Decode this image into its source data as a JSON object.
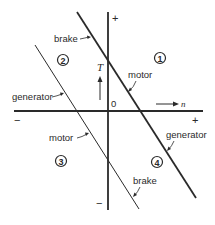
{
  "diagram": {
    "type": "four-quadrant torque-speed diagram",
    "axes": {
      "vertical": {
        "label": "T",
        "positive": "+",
        "negative": "−"
      },
      "horizontal": {
        "label": "n",
        "positive": "+",
        "negative": "−"
      },
      "origin": "0"
    },
    "quadrants": [
      {
        "id": "1",
        "symbol": "①"
      },
      {
        "id": "2",
        "symbol": "②"
      },
      {
        "id": "3",
        "symbol": "③"
      },
      {
        "id": "4",
        "symbol": "④"
      }
    ],
    "characteristics": [
      {
        "name": "forward characteristic",
        "style": "thick",
        "segments": {
          "upper_left": "brake",
          "middle": "motor",
          "lower_right": "generator"
        }
      },
      {
        "name": "reverse characteristic",
        "style": "thin",
        "segments": {
          "upper_left": "generator",
          "middle": "motor",
          "lower_right": "brake"
        }
      }
    ],
    "labels": {
      "brake_top": "brake",
      "motor_right": "motor",
      "generator_left": "generator",
      "motor_left": "motor",
      "generator_right": "generator",
      "brake_bottom": "brake"
    }
  }
}
